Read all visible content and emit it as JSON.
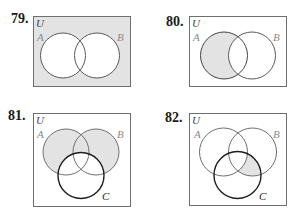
{
  "colors": {
    "shade": "#e3e3e3",
    "outline_light": "#6e6e6e",
    "outline_dark": "#1e1e1e",
    "label_gray": "#8a8a8a",
    "number": "#1a1a1a"
  },
  "problems": [
    {
      "number": "79.",
      "universe_label": "U",
      "sets": [
        "A",
        "B"
      ],
      "shaded": "complement of (A ∪ B)"
    },
    {
      "number": "80.",
      "universe_label": "U",
      "sets": [
        "A",
        "B"
      ],
      "shaded": "A − B"
    },
    {
      "number": "81.",
      "universe_label": "U",
      "sets": [
        "A",
        "B",
        "C"
      ],
      "shaded": "(A ∪ B) − C"
    },
    {
      "number": "82.",
      "universe_label": "U",
      "sets": [
        "A",
        "B",
        "C"
      ],
      "shaded": "(B ∩ C) − A"
    }
  ]
}
